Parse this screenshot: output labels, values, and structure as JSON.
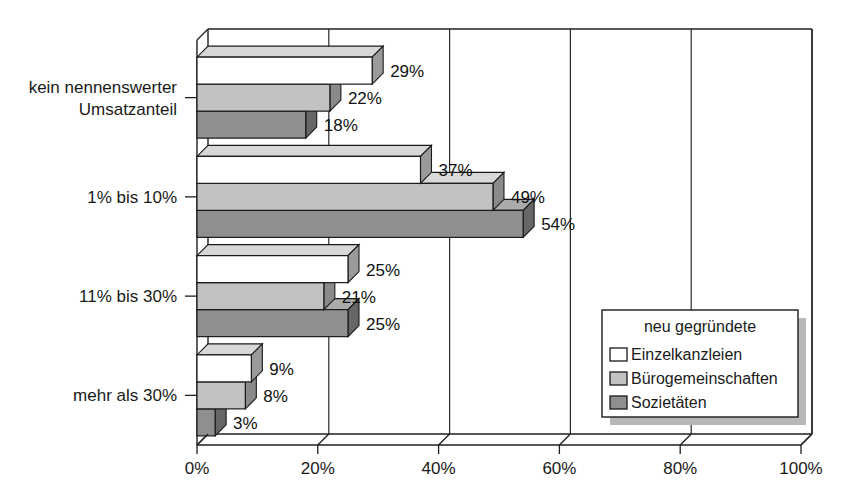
{
  "chart_data": {
    "type": "bar",
    "orientation": "horizontal",
    "style": "3d-grouped-bar",
    "title": "",
    "subtitle": "",
    "xlabel": "",
    "ylabel": "",
    "xlim": [
      0,
      100
    ],
    "xticks": [
      0,
      20,
      40,
      60,
      80,
      100
    ],
    "xtick_labels": [
      "0%",
      "20%",
      "40%",
      "60%",
      "80%",
      "100%"
    ],
    "grid": true,
    "grid_axis": "x",
    "legend_position": "bottom-right",
    "legend_title": "neu gegründete",
    "categories": [
      "kein nennenswerter Umsatzanteil",
      "1% bis 10%",
      "11% bis 30%",
      "mehr als 30%"
    ],
    "category_lines": [
      [
        "kein nennenswerter",
        "Umsatzanteil"
      ],
      [
        "1% bis 10%"
      ],
      [
        "11% bis 30%"
      ],
      [
        "mehr als 30%"
      ]
    ],
    "series": [
      {
        "name": "Einzelkanzleien",
        "color": "#ffffff",
        "top_color": "#d7d7d7",
        "side_color": "#9a9a9a",
        "values": [
          29,
          37,
          25,
          9
        ],
        "value_labels": [
          "29%",
          "37%",
          "25%",
          "9%"
        ]
      },
      {
        "name": "Bürogemeinschaften",
        "color": "#c2c2c2",
        "top_color": "#d9d9d9",
        "side_color": "#8a8a8a",
        "values": [
          22,
          49,
          21,
          8
        ],
        "value_labels": [
          "22%",
          "49%",
          "21%",
          "8%"
        ]
      },
      {
        "name": "Sozietäten",
        "color": "#8f8f8f",
        "top_color": "#ababab",
        "side_color": "#666666",
        "values": [
          18,
          54,
          25,
          3
        ],
        "value_labels": [
          "18%",
          "54%",
          "25%",
          "3%"
        ]
      }
    ]
  },
  "legend": {
    "title": "neu gegründete",
    "items": [
      {
        "label": "Einzelkanzleien",
        "swatch": "#ffffff"
      },
      {
        "label": "Bürogemeinschaften",
        "swatch": "#c2c2c2"
      },
      {
        "label": "Sozietäten",
        "swatch": "#8f8f8f"
      }
    ]
  },
  "axis": {
    "x_tick_labels": [
      "0%",
      "20%",
      "40%",
      "60%",
      "80%",
      "100%"
    ],
    "y_category_labels": [
      "kein nennenswerter Umsatzanteil",
      "1% bis 10%",
      "11% bis 30%",
      "mehr als 30%"
    ]
  }
}
